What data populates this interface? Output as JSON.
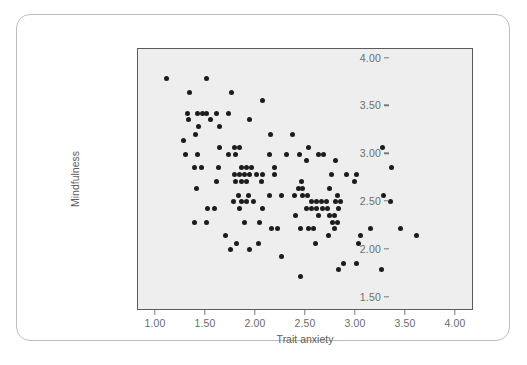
{
  "figure": {
    "background_color": "#ffffff",
    "card_border_color": "#bdbdbd",
    "plot_background_color": "#eeeeee",
    "plot_border_color": "#5b5b5b",
    "point_color": "#1c1c1c",
    "tick_label_color": "#6d6d6d",
    "axis_title_color": "#5e5e5e"
  },
  "chart_data": {
    "type": "scatter",
    "title": "",
    "xlabel": "Trait anxiety",
    "ylabel": "Mindfulness",
    "xlim": [
      0.82,
      4.18
    ],
    "ylim": [
      1.36,
      4.1
    ],
    "xticks": [
      1.0,
      1.5,
      2.0,
      2.5,
      3.0,
      3.5,
      4.0
    ],
    "xticklabels": [
      "1.00",
      "1.50",
      "2.00",
      "2.50",
      "3.00",
      "3.50",
      "4.00"
    ],
    "yticks": [
      1.5,
      2.0,
      2.5,
      3.0,
      3.5,
      4.0
    ],
    "yticklabels": [
      "1.50",
      "2.00",
      "2.50",
      "3.00",
      "3.50",
      "4.00"
    ],
    "grid": false,
    "legend": null,
    "marker": "circle",
    "marker_size_px": 5,
    "n_points": 150,
    "relationship": "negative",
    "points": [
      [
        1.1,
        3.79
      ],
      [
        1.5,
        3.79
      ],
      [
        1.33,
        3.64
      ],
      [
        1.75,
        3.64
      ],
      [
        2.06,
        3.56
      ],
      [
        1.31,
        3.43
      ],
      [
        1.41,
        3.43
      ],
      [
        1.46,
        3.43
      ],
      [
        1.5,
        3.43
      ],
      [
        1.6,
        3.43
      ],
      [
        1.72,
        3.43
      ],
      [
        1.32,
        3.36
      ],
      [
        1.54,
        3.36
      ],
      [
        1.93,
        3.36
      ],
      [
        1.42,
        3.29
      ],
      [
        1.63,
        3.29
      ],
      [
        1.39,
        3.21
      ],
      [
        2.14,
        3.21
      ],
      [
        2.36,
        3.21
      ],
      [
        1.27,
        3.14
      ],
      [
        1.63,
        3.07
      ],
      [
        1.78,
        3.07
      ],
      [
        1.83,
        3.07
      ],
      [
        2.52,
        3.07
      ],
      [
        3.26,
        3.07
      ],
      [
        1.29,
        3.0
      ],
      [
        1.41,
        3.0
      ],
      [
        1.72,
        3.0
      ],
      [
        1.79,
        3.0
      ],
      [
        2.13,
        3.0
      ],
      [
        2.3,
        3.0
      ],
      [
        2.43,
        3.0
      ],
      [
        2.62,
        3.0
      ],
      [
        2.67,
        3.0
      ],
      [
        2.5,
        2.93
      ],
      [
        2.79,
        2.93
      ],
      [
        1.38,
        2.86
      ],
      [
        1.45,
        2.86
      ],
      [
        1.62,
        2.86
      ],
      [
        1.85,
        2.86
      ],
      [
        1.9,
        2.86
      ],
      [
        1.95,
        2.86
      ],
      [
        2.18,
        2.86
      ],
      [
        3.35,
        2.86
      ],
      [
        1.78,
        2.79
      ],
      [
        1.83,
        2.79
      ],
      [
        1.88,
        2.79
      ],
      [
        1.93,
        2.79
      ],
      [
        2.0,
        2.79
      ],
      [
        2.06,
        2.79
      ],
      [
        2.18,
        2.79
      ],
      [
        2.75,
        2.79
      ],
      [
        2.9,
        2.79
      ],
      [
        3.0,
        2.79
      ],
      [
        1.6,
        2.71
      ],
      [
        1.79,
        2.71
      ],
      [
        1.85,
        2.71
      ],
      [
        1.9,
        2.71
      ],
      [
        2.05,
        2.71
      ],
      [
        2.45,
        2.71
      ],
      [
        2.98,
        2.71
      ],
      [
        1.4,
        2.64
      ],
      [
        2.42,
        2.64
      ],
      [
        2.46,
        2.64
      ],
      [
        2.73,
        2.64
      ],
      [
        1.82,
        2.57
      ],
      [
        1.92,
        2.57
      ],
      [
        2.13,
        2.57
      ],
      [
        2.25,
        2.57
      ],
      [
        2.38,
        2.57
      ],
      [
        2.46,
        2.57
      ],
      [
        2.51,
        2.57
      ],
      [
        2.81,
        2.57
      ],
      [
        3.27,
        2.57
      ],
      [
        1.77,
        2.5
      ],
      [
        1.85,
        2.5
      ],
      [
        1.9,
        2.5
      ],
      [
        1.97,
        2.5
      ],
      [
        2.55,
        2.5
      ],
      [
        2.6,
        2.5
      ],
      [
        2.65,
        2.5
      ],
      [
        2.7,
        2.5
      ],
      [
        2.79,
        2.5
      ],
      [
        2.84,
        2.5
      ],
      [
        3.34,
        2.5
      ],
      [
        1.51,
        2.43
      ],
      [
        1.58,
        2.43
      ],
      [
        1.83,
        2.43
      ],
      [
        2.06,
        2.43
      ],
      [
        2.5,
        2.43
      ],
      [
        2.55,
        2.43
      ],
      [
        2.6,
        2.43
      ],
      [
        2.66,
        2.43
      ],
      [
        2.71,
        2.43
      ],
      [
        2.82,
        2.43
      ],
      [
        2.39,
        2.36
      ],
      [
        2.62,
        2.36
      ],
      [
        2.73,
        2.36
      ],
      [
        2.78,
        2.36
      ],
      [
        1.38,
        2.29
      ],
      [
        1.5,
        2.29
      ],
      [
        1.88,
        2.29
      ],
      [
        2.03,
        2.29
      ],
      [
        2.76,
        2.29
      ],
      [
        2.81,
        2.29
      ],
      [
        2.15,
        2.22
      ],
      [
        2.21,
        2.22
      ],
      [
        2.44,
        2.22
      ],
      [
        2.52,
        2.22
      ],
      [
        2.57,
        2.22
      ],
      [
        2.78,
        2.22
      ],
      [
        3.14,
        2.22
      ],
      [
        3.44,
        2.22
      ],
      [
        1.69,
        2.15
      ],
      [
        2.72,
        2.15
      ],
      [
        3.04,
        2.15
      ],
      [
        3.6,
        2.15
      ],
      [
        1.8,
        2.07
      ],
      [
        2.02,
        2.07
      ],
      [
        2.59,
        2.07
      ],
      [
        3.02,
        2.07
      ],
      [
        1.74,
        2.0
      ],
      [
        1.93,
        2.0
      ],
      [
        2.25,
        1.93
      ],
      [
        2.87,
        1.86
      ],
      [
        3.0,
        1.86
      ],
      [
        2.82,
        1.79
      ],
      [
        3.25,
        1.79
      ],
      [
        2.44,
        1.72
      ]
    ]
  },
  "axes": {
    "y_title": "Mindfulness",
    "x_title": "Trait anxiety"
  },
  "page_bleed_text": ""
}
